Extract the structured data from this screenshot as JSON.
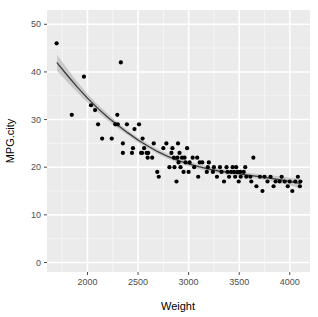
{
  "figure": {
    "panel_background": "#ebebeb",
    "outer_background": "#ffffff",
    "major_grid_color": "#ffffff",
    "minor_grid_color": "#f5f5f5",
    "point_color": "#000000",
    "line_color": "#3b3b3b",
    "band_color": "#b3b3b3",
    "tick_color": "#4d4d4d"
  },
  "chart_data": {
    "type": "scatter",
    "title": "",
    "subtitle": "",
    "xlabel": "Weight",
    "ylabel": "MPG.city",
    "xlim": [
      1600,
      4200
    ],
    "ylim": [
      -2,
      53
    ],
    "grid": true,
    "legend": "none",
    "x_ticks": [
      2000,
      2500,
      3000,
      3500,
      4000
    ],
    "y_ticks": [
      0,
      10,
      20,
      30,
      40,
      50
    ],
    "x_tick_labels": [
      "2000",
      "2500",
      "3000",
      "3500",
      "4000"
    ],
    "y_tick_labels": [
      "0",
      "10",
      "20",
      "30",
      "40",
      "50"
    ],
    "x_minor_ticks": [
      1750,
      2250,
      2750,
      3250,
      3750,
      4250
    ],
    "y_minor_ticks": [
      5,
      15,
      25,
      35,
      45
    ],
    "series": [
      {
        "name": "Cars93",
        "type": "scatter",
        "x": [
          1695,
          1845,
          1965,
          2035,
          2075,
          2105,
          2145,
          2240,
          2275,
          2295,
          2300,
          2330,
          2350,
          2350,
          2390,
          2440,
          2450,
          2465,
          2510,
          2530,
          2540,
          2545,
          2560,
          2585,
          2595,
          2600,
          2640,
          2655,
          2690,
          2705,
          2750,
          2780,
          2810,
          2830,
          2840,
          2855,
          2860,
          2880,
          2890,
          2895,
          2900,
          2910,
          2920,
          2935,
          2950,
          2960,
          2970,
          2985,
          3000,
          3010,
          3040,
          3055,
          3085,
          3095,
          3110,
          3135,
          3180,
          3190,
          3200,
          3240,
          3250,
          3280,
          3310,
          3325,
          3350,
          3375,
          3385,
          3400,
          3420,
          3435,
          3450,
          3460,
          3470,
          3485,
          3495,
          3510,
          3515,
          3545,
          3560,
          3570,
          3610,
          3620,
          3640,
          3670,
          3705,
          3730,
          3750,
          3780,
          3810,
          3840,
          3860,
          3900,
          3920,
          3950,
          3980,
          4000,
          4025,
          4055,
          4080,
          4100,
          4105
        ],
        "y": [
          46,
          31,
          39,
          33,
          32,
          29,
          26,
          26,
          29,
          31,
          29,
          42,
          25,
          23,
          29,
          23,
          24,
          28,
          29,
          23,
          23,
          26,
          24,
          23,
          22,
          23,
          22,
          25,
          19,
          18,
          24,
          25,
          20,
          23,
          24,
          22,
          20,
          17,
          22,
          25,
          21,
          23,
          20,
          22,
          19,
          22,
          21,
          24,
          19,
          21,
          22,
          20,
          22,
          18,
          21,
          21,
          19,
          20,
          21,
          19,
          20,
          18,
          20,
          19,
          17,
          20,
          19,
          18,
          19,
          20,
          19,
          18,
          20,
          19,
          17,
          19,
          18,
          19,
          20,
          18,
          18,
          17,
          22,
          16,
          18,
          15,
          18,
          17,
          18,
          16,
          17,
          17,
          18,
          17,
          16,
          17,
          15,
          17,
          18,
          16,
          17
        ]
      },
      {
        "name": "loess fit",
        "type": "line",
        "x": [
          1700,
          1800,
          1900,
          2000,
          2100,
          2200,
          2300,
          2400,
          2500,
          2600,
          2700,
          2800,
          2900,
          3000,
          3100,
          3200,
          3300,
          3400,
          3500,
          3600,
          3700,
          3800,
          3900,
          4000,
          4100
        ],
        "y": [
          41.9,
          39.3,
          36.8,
          34.5,
          32.4,
          30.5,
          28.8,
          27.2,
          25.7,
          24.4,
          23.2,
          22.2,
          21.4,
          20.7,
          20.1,
          19.6,
          19.2,
          18.9,
          18.6,
          18.3,
          18.0,
          17.7,
          17.4,
          17.0,
          16.6
        ],
        "ci_upper": [
          43.6,
          40.7,
          37.9,
          35.4,
          33.2,
          31.2,
          29.4,
          27.7,
          26.2,
          24.9,
          23.7,
          22.7,
          21.9,
          21.2,
          20.6,
          20.1,
          19.7,
          19.4,
          19.1,
          18.8,
          18.5,
          18.3,
          18.1,
          17.8,
          17.6
        ],
        "ci_lower": [
          40.2,
          37.9,
          35.7,
          33.6,
          31.6,
          29.8,
          28.2,
          26.7,
          25.2,
          23.9,
          22.7,
          21.7,
          20.9,
          20.2,
          19.6,
          19.1,
          18.7,
          18.4,
          18.1,
          17.8,
          17.5,
          17.1,
          16.7,
          16.2,
          15.6
        ]
      }
    ]
  }
}
